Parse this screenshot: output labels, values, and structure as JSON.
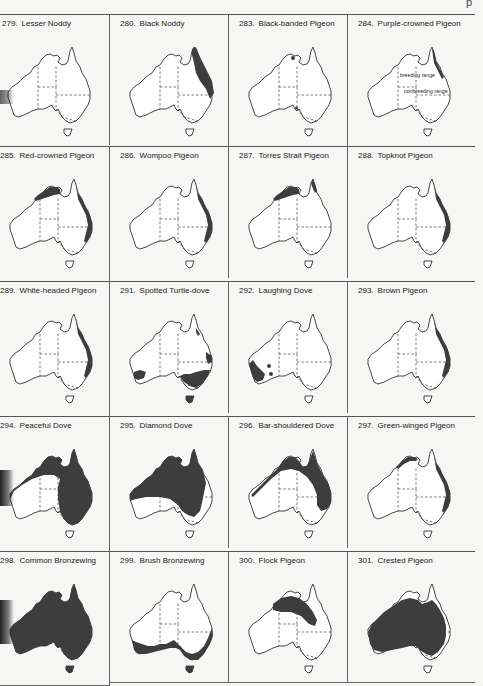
{
  "page": {
    "corner_mark": "p"
  },
  "plates": [
    {
      "number": "279.",
      "name": "Lesser Noddy",
      "ranges": [],
      "legend": null
    },
    {
      "number": "280.",
      "name": "Black Noddy",
      "ranges": [
        "ne-coast-wide"
      ],
      "legend": null
    },
    {
      "number": "283.",
      "name": "Black-banded Pigeon",
      "ranges": [
        "arnhem-dot"
      ],
      "legend": null
    },
    {
      "number": "284.",
      "name": "Purple-crowned Pigeon",
      "ranges": [
        "ne-coast-thin"
      ],
      "legend": {
        "breeding": "breeding range",
        "nonbreeding": "nonbreeding range"
      }
    },
    {
      "number": "285.",
      "name": "Red-crowned Pigeon",
      "ranges": [
        "north-kimberley-arnhem",
        "east-coast"
      ],
      "legend": null
    },
    {
      "number": "286.",
      "name": "Wompoo Pigeon",
      "ranges": [
        "east-coast"
      ],
      "legend": null
    },
    {
      "number": "287.",
      "name": "Torres Strait Pigeon",
      "ranges": [
        "north-kimberley-arnhem",
        "cape-york-tip"
      ],
      "legend": null
    },
    {
      "number": "288.",
      "name": "Topknot Pigeon",
      "ranges": [
        "east-coast"
      ],
      "legend": null
    },
    {
      "number": "289.",
      "name": "White-headed Pigeon",
      "ranges": [
        "east-coast"
      ],
      "legend": null
    },
    {
      "number": "291.",
      "name": "Spotted Turtle-dove",
      "ranges": [
        "southeast",
        "southwest-small",
        "qld-coast"
      ],
      "legend": null
    },
    {
      "number": "292.",
      "name": "Laughing Dove",
      "ranges": [
        "southwest"
      ],
      "legend": null
    },
    {
      "number": "293.",
      "name": "Brown Pigeon",
      "ranges": [
        "east-coast"
      ],
      "legend": null
    },
    {
      "number": "294.",
      "name": "Peaceful Dove",
      "ranges": [
        "north-east-broad"
      ],
      "legend": null
    },
    {
      "number": "295.",
      "name": "Diamond Dove",
      "ranges": [
        "inland-broad"
      ],
      "legend": null
    },
    {
      "number": "296.",
      "name": "Bar-shouldered Dove",
      "ranges": [
        "north-arc"
      ],
      "legend": null
    },
    {
      "number": "297.",
      "name": "Green-winged Pigeon",
      "ranges": [
        "north-kimberley-arnhem-thin",
        "east-coast"
      ],
      "legend": null
    },
    {
      "number": "298.",
      "name": "Common Bronzewing",
      "ranges": [
        "all"
      ],
      "legend": null
    },
    {
      "number": "299.",
      "name": "Brush Bronzewing",
      "ranges": [
        "south-coast"
      ],
      "legend": null
    },
    {
      "number": "300.",
      "name": "Flock Pigeon",
      "ranges": [
        "inland-blob"
      ],
      "legend": null
    },
    {
      "number": "301.",
      "name": "Crested Pigeon",
      "ranges": [
        "mainland-interior"
      ],
      "legend": null
    }
  ]
}
